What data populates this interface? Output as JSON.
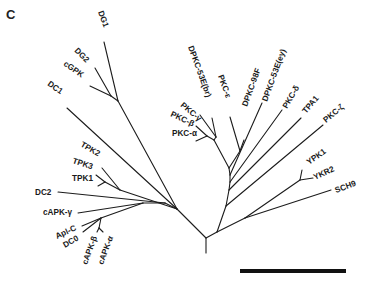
{
  "figure": {
    "panel_label": "C",
    "scale_bar": {
      "x1": 240,
      "y1": 271,
      "x2": 346,
      "y2": 271
    }
  },
  "tree": {
    "root": {
      "x": 206,
      "y": 238
    },
    "stem": {
      "x1": 206,
      "y1": 238,
      "x2": 206,
      "y2": 253
    },
    "branches": [
      {
        "x1": 206,
        "y1": 238,
        "x2": 177,
        "y2": 209
      },
      {
        "x1": 206,
        "y1": 238,
        "x2": 217,
        "y2": 232
      },
      {
        "x1": 177,
        "y1": 209,
        "x2": 118,
        "y2": 101
      },
      {
        "x1": 118,
        "y1": 101,
        "x2": 104,
        "y2": 42
      },
      {
        "x1": 118,
        "y1": 101,
        "x2": 111,
        "y2": 96
      },
      {
        "x1": 111,
        "y1": 96,
        "x2": 95,
        "y2": 68
      },
      {
        "x1": 111,
        "y1": 96,
        "x2": 90,
        "y2": 86
      },
      {
        "x1": 177,
        "y1": 209,
        "x2": 67,
        "y2": 108
      },
      {
        "x1": 177,
        "y1": 209,
        "x2": 120,
        "y2": 190
      },
      {
        "x1": 120,
        "y1": 190,
        "x2": 102,
        "y2": 168
      },
      {
        "x1": 120,
        "y1": 190,
        "x2": 105,
        "y2": 182
      },
      {
        "x1": 105,
        "y1": 182,
        "x2": 96,
        "y2": 175
      },
      {
        "x1": 105,
        "y1": 182,
        "x2": 98,
        "y2": 186
      },
      {
        "x1": 177,
        "y1": 209,
        "x2": 165,
        "y2": 203
      },
      {
        "x1": 165,
        "y1": 203,
        "x2": 58,
        "y2": 192
      },
      {
        "x1": 165,
        "y1": 203,
        "x2": 143,
        "y2": 203
      },
      {
        "x1": 143,
        "y1": 203,
        "x2": 78,
        "y2": 213
      },
      {
        "x1": 143,
        "y1": 203,
        "x2": 101,
        "y2": 218
      },
      {
        "x1": 101,
        "y1": 218,
        "x2": 82,
        "y2": 226
      },
      {
        "x1": 101,
        "y1": 218,
        "x2": 83,
        "y2": 232
      },
      {
        "x1": 101,
        "y1": 218,
        "x2": 99,
        "y2": 228
      },
      {
        "x1": 99,
        "y1": 228,
        "x2": 97,
        "y2": 232
      },
      {
        "x1": 99,
        "y1": 228,
        "x2": 103,
        "y2": 232
      },
      {
        "x1": 217,
        "y1": 232,
        "x2": 245,
        "y2": 218
      },
      {
        "x1": 245,
        "y1": 218,
        "x2": 331,
        "y2": 190
      },
      {
        "x1": 245,
        "y1": 218,
        "x2": 300,
        "y2": 180
      },
      {
        "x1": 300,
        "y1": 180,
        "x2": 302,
        "y2": 170
      },
      {
        "x1": 300,
        "y1": 180,
        "x2": 313,
        "y2": 178
      },
      {
        "x1": 217,
        "y1": 232,
        "x2": 226,
        "y2": 206
      },
      {
        "x1": 226,
        "y1": 206,
        "x2": 323,
        "y2": 125
      },
      {
        "x1": 226,
        "y1": 206,
        "x2": 229,
        "y2": 190
      },
      {
        "x1": 229,
        "y1": 190,
        "x2": 301,
        "y2": 118
      },
      {
        "x1": 229,
        "y1": 190,
        "x2": 230,
        "y2": 182
      },
      {
        "x1": 230,
        "y1": 182,
        "x2": 282,
        "y2": 110
      },
      {
        "x1": 230,
        "y1": 182,
        "x2": 230,
        "y2": 175
      },
      {
        "x1": 230,
        "y1": 175,
        "x2": 262,
        "y2": 103
      },
      {
        "x1": 230,
        "y1": 175,
        "x2": 229,
        "y2": 168
      },
      {
        "x1": 229,
        "y1": 168,
        "x2": 240,
        "y2": 151
      },
      {
        "x1": 240,
        "y1": 151,
        "x2": 244,
        "y2": 140
      },
      {
        "x1": 240,
        "y1": 151,
        "x2": 230,
        "y2": 117
      },
      {
        "x1": 229,
        "y1": 168,
        "x2": 214,
        "y2": 140
      },
      {
        "x1": 214,
        "y1": 140,
        "x2": 216,
        "y2": 137
      },
      {
        "x1": 216,
        "y1": 137,
        "x2": 212,
        "y2": 118
      },
      {
        "x1": 216,
        "y1": 137,
        "x2": 200,
        "y2": 115
      },
      {
        "x1": 214,
        "y1": 140,
        "x2": 207,
        "y2": 136
      },
      {
        "x1": 207,
        "y1": 136,
        "x2": 196,
        "y2": 126
      },
      {
        "x1": 207,
        "y1": 136,
        "x2": 196,
        "y2": 141
      }
    ],
    "leaves": [
      {
        "label": "DG1",
        "x": 98,
        "y": 12,
        "rotate": 70
      },
      {
        "label": "DG2",
        "x": 74,
        "y": 51,
        "rotate": 45
      },
      {
        "label": "cGPK",
        "x": 63,
        "y": 65,
        "rotate": 35
      },
      {
        "label": "DC1",
        "x": 47,
        "y": 85,
        "rotate": 35
      },
      {
        "label": "TPK2",
        "x": 80,
        "y": 146,
        "rotate": 30
      },
      {
        "label": "TPK3",
        "x": 72,
        "y": 163,
        "rotate": 18
      },
      {
        "label": "TPK1",
        "x": 72,
        "y": 181,
        "rotate": 0
      },
      {
        "label": "DC2",
        "x": 35,
        "y": 195,
        "rotate": 0
      },
      {
        "label": "cAPK-γ",
        "x": 43,
        "y": 215,
        "rotate": 0
      },
      {
        "label": "Apl-C",
        "x": 57,
        "y": 239,
        "rotate": -25
      },
      {
        "label": "DC0",
        "x": 65,
        "y": 248,
        "rotate": -30
      },
      {
        "label": "cAPK-β",
        "x": 87,
        "y": 265,
        "rotate": -70
      },
      {
        "label": "cAPK-α",
        "x": 103,
        "y": 265,
        "rotate": -70
      },
      {
        "label": "PKC-α",
        "x": 172,
        "y": 136,
        "rotate": 0
      },
      {
        "label": "PKC-β",
        "x": 170,
        "y": 116,
        "rotate": 25
      },
      {
        "label": "PKC-γ",
        "x": 180,
        "y": 106,
        "rotate": 40
      },
      {
        "label": "DPKC-53E(br)",
        "x": 188,
        "y": 47,
        "rotate": 70
      },
      {
        "label": "PKC-ε",
        "x": 218,
        "y": 76,
        "rotate": 70
      },
      {
        "label": "DPKC-98F",
        "x": 247,
        "y": 107,
        "rotate": -70
      },
      {
        "label": "DPKC-53E(ey)",
        "x": 267,
        "y": 102,
        "rotate": -70
      },
      {
        "label": "PKC-δ",
        "x": 287,
        "y": 109,
        "rotate": -60
      },
      {
        "label": "TPA1",
        "x": 306,
        "y": 114,
        "rotate": -50
      },
      {
        "label": "PKC-ζ",
        "x": 326,
        "y": 123,
        "rotate": -40
      },
      {
        "label": "YPK1",
        "x": 309,
        "y": 165,
        "rotate": -35
      },
      {
        "label": "YKR2",
        "x": 315,
        "y": 180,
        "rotate": -25
      },
      {
        "label": "SCH9",
        "x": 336,
        "y": 193,
        "rotate": -20
      }
    ]
  }
}
